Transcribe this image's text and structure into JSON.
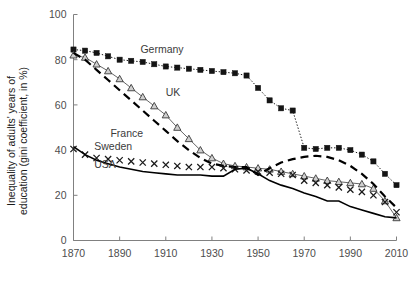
{
  "chart_data": {
    "type": "line",
    "title": "",
    "xlabel": "",
    "ylabel": "Inequality of adults' years of education (gini coefficient, in %)",
    "ylabel_line1": "Inequality of adults' years of",
    "ylabel_line2": "education (gini coefficient, in %)",
    "xlim": [
      1870,
      2010
    ],
    "ylim": [
      0,
      100
    ],
    "xticks": [
      1870,
      1890,
      1910,
      1930,
      1950,
      1970,
      1990,
      2010
    ],
    "yticks": [
      0,
      20,
      40,
      60,
      80,
      100
    ],
    "grid": false,
    "legend_position": "inline-annotations",
    "series": [
      {
        "name": "Germany",
        "label": "Germany",
        "marker": "square",
        "linestyle": "dotted",
        "color": "#141414",
        "label_x": 1899,
        "label_y": 83,
        "x": [
          1870,
          1875,
          1880,
          1885,
          1890,
          1895,
          1900,
          1905,
          1910,
          1915,
          1920,
          1925,
          1930,
          1935,
          1940,
          1945,
          1950,
          1955,
          1960,
          1965,
          1970,
          1975,
          1980,
          1985,
          1990,
          1995,
          2000,
          2005,
          2010
        ],
        "y": [
          84.5,
          84.0,
          83.0,
          81.5,
          80.0,
          79.5,
          79.0,
          78.0,
          77.0,
          76.5,
          76.0,
          75.5,
          75.0,
          74.5,
          74.0,
          73.0,
          67.5,
          62.0,
          58.5,
          57.5,
          41.0,
          40.5,
          41.0,
          41.0,
          40.0,
          38.0,
          35.0,
          29.5,
          24.5
        ]
      },
      {
        "name": "UK",
        "label": "UK",
        "marker": "triangle",
        "linestyle": "solid-thin",
        "color": "#555555",
        "label_x": 1910,
        "label_y": 64,
        "x": [
          1870,
          1875,
          1880,
          1885,
          1890,
          1895,
          1900,
          1905,
          1910,
          1915,
          1920,
          1925,
          1930,
          1935,
          1940,
          1945,
          1950,
          1955,
          1960,
          1965,
          1970,
          1975,
          1980,
          1985,
          1990,
          1995,
          2000,
          2005,
          2010
        ],
        "y": [
          82.0,
          81.0,
          78.0,
          75.0,
          71.5,
          67.5,
          63.5,
          59.5,
          55.5,
          50.0,
          45.0,
          40.0,
          36.5,
          34.0,
          33.0,
          32.5,
          32.0,
          31.5,
          30.5,
          29.5,
          28.5,
          27.5,
          26.5,
          26.0,
          25.5,
          25.0,
          23.0,
          17.5,
          10.0
        ]
      },
      {
        "name": "France",
        "label": "France",
        "marker": "none",
        "linestyle": "dashed-thick",
        "color": "#000000",
        "label_x": 1886,
        "label_y": 46,
        "x": [
          1870,
          1875,
          1880,
          1885,
          1890,
          1895,
          1900,
          1905,
          1910,
          1915,
          1920,
          1925,
          1930,
          1935,
          1940,
          1945,
          1950,
          1955,
          1960,
          1965,
          1970,
          1975,
          1980,
          1985,
          1990,
          1995,
          2000,
          2005,
          2010
        ],
        "y": [
          83.0,
          80.0,
          75.5,
          71.0,
          66.5,
          62.0,
          57.5,
          53.0,
          48.5,
          44.0,
          40.0,
          36.5,
          34.0,
          33.0,
          32.5,
          32.5,
          29.0,
          32.0,
          34.5,
          36.0,
          37.0,
          37.5,
          37.0,
          35.5,
          33.0,
          29.5,
          25.0,
          19.5,
          14.5
        ]
      },
      {
        "name": "Sweden",
        "label": "Sweden",
        "marker": "x",
        "linestyle": "none",
        "color": "#1a1a1a",
        "label_x": 1879,
        "label_y": 40,
        "x": [
          1870,
          1875,
          1880,
          1885,
          1890,
          1895,
          1900,
          1905,
          1910,
          1915,
          1920,
          1925,
          1930,
          1935,
          1940,
          1945,
          1950,
          1955,
          1960,
          1965,
          1970,
          1975,
          1980,
          1985,
          1990,
          1995,
          2000,
          2005,
          2010
        ],
        "y": [
          40.5,
          38.0,
          36.5,
          36.0,
          35.5,
          35.0,
          34.5,
          34.0,
          33.5,
          33.0,
          32.5,
          32.5,
          32.5,
          32.0,
          31.5,
          31.0,
          30.5,
          30.0,
          29.5,
          29.0,
          26.5,
          25.5,
          24.5,
          23.5,
          22.5,
          21.5,
          20.0,
          17.0,
          12.5
        ]
      },
      {
        "name": "USA",
        "label": "USA",
        "marker": "none",
        "linestyle": "solid",
        "color": "#000000",
        "label_x": 1879,
        "label_y": 32,
        "x": [
          1870,
          1875,
          1880,
          1885,
          1890,
          1895,
          1900,
          1905,
          1910,
          1915,
          1920,
          1925,
          1930,
          1935,
          1940,
          1945,
          1950,
          1955,
          1960,
          1965,
          1970,
          1975,
          1980,
          1985,
          1990,
          1995,
          2000,
          2005,
          2010
        ],
        "y": [
          41.5,
          38.0,
          35.5,
          34.0,
          32.5,
          31.5,
          30.5,
          30.0,
          29.5,
          29.0,
          29.0,
          29.0,
          28.5,
          28.5,
          31.5,
          32.0,
          29.5,
          26.5,
          24.5,
          23.0,
          21.0,
          19.5,
          17.5,
          17.5,
          15.0,
          13.5,
          12.0,
          10.5,
          10.0
        ]
      }
    ]
  },
  "axes": {
    "yticklabels": [
      "0",
      "20",
      "40",
      "60",
      "80",
      "100"
    ],
    "xticklabels": [
      "1870",
      "1890",
      "1910",
      "1930",
      "1950",
      "1970",
      "1990",
      "2010"
    ]
  }
}
